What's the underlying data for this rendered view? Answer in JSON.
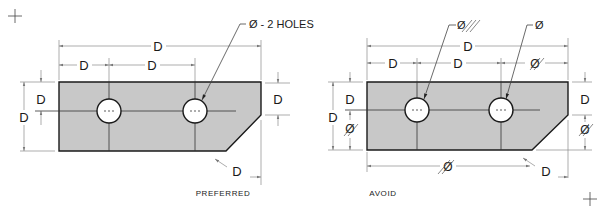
{
  "figure": {
    "panels": [
      {
        "id": "preferred",
        "caption": "PREFERRED",
        "note": "Ø - 2 HOLES",
        "dimensions": {
          "overall_width": "D",
          "left_to_hole1": "D",
          "hole1_to_hole2": "D",
          "top_to_centerline": "D",
          "overall_height": "D",
          "right_height": "D",
          "chamfer": "D"
        }
      },
      {
        "id": "avoid",
        "caption": "AVOID",
        "note_left": "Ø",
        "note_right": "Ø",
        "dimensions": {
          "overall_width": "D",
          "left_to_hole1": "D",
          "hole1_to_hole2": "D",
          "hole2_to_right": "Ø",
          "top_to_centerline": "D",
          "overall_height": "D",
          "centerline_to_bottom": "Ø",
          "right_height": "D",
          "right_lower": "Ø",
          "bottom_length": "Ø",
          "chamfer": "D"
        }
      }
    ],
    "colors": {
      "plate_fill": "#c8c8c8",
      "outline": "#1a1a1a",
      "dim_line": "#8a8a8a"
    }
  }
}
